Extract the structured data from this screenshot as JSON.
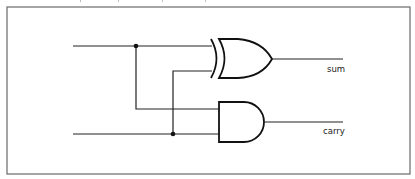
{
  "diagram": {
    "type": "half-adder logic circuit",
    "gates": [
      {
        "id": "xor",
        "kind": "XOR",
        "output_label": "sum"
      },
      {
        "id": "and",
        "kind": "AND",
        "output_label": "carry"
      }
    ],
    "inputs": [
      {
        "id": "a",
        "connects_to": [
          "xor",
          "and"
        ]
      },
      {
        "id": "b",
        "connects_to": [
          "xor",
          "and"
        ]
      }
    ],
    "outputs": {
      "sum": "sum",
      "carry": "carry"
    }
  }
}
